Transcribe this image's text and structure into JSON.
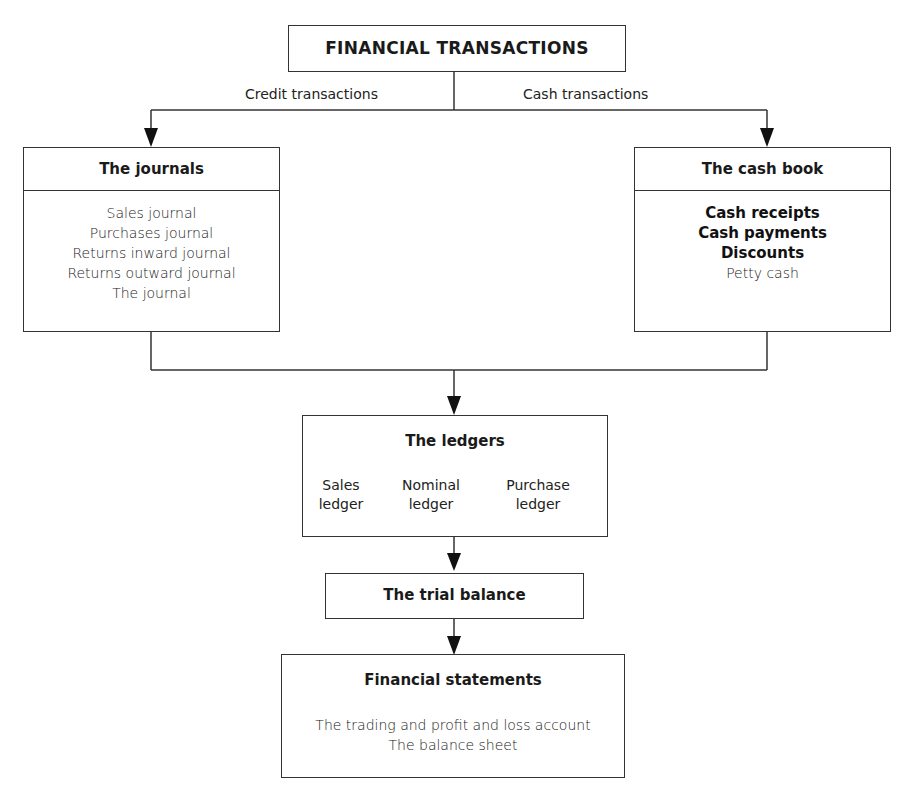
{
  "diagram": {
    "root": {
      "title": "FINANCIAL TRANSACTIONS"
    },
    "branches": {
      "credit_label": "Credit transactions",
      "cash_label": "Cash transactions"
    },
    "journals": {
      "title": "The journals",
      "items": [
        "Sales journal",
        "Purchases journal",
        "Returns inward journal",
        "Returns outward journal",
        "The journal"
      ]
    },
    "cash_book": {
      "title": "The cash book",
      "items": [
        {
          "label": "Cash receipts",
          "bold": true
        },
        {
          "label": "Cash payments",
          "bold": true
        },
        {
          "label": "Discounts",
          "bold": true
        },
        {
          "label": "Petty cash",
          "bold": false
        }
      ]
    },
    "ledgers": {
      "title": "The ledgers",
      "columns": [
        {
          "line1": "Sales",
          "line2": "ledger"
        },
        {
          "line1": "Nominal",
          "line2": "ledger"
        },
        {
          "line1": "Purchase",
          "line2": "ledger"
        }
      ]
    },
    "trial_balance": {
      "title": "The trial balance"
    },
    "financial_statements": {
      "title": "Financial statements",
      "items": [
        "The trading and profit and loss account",
        "The balance sheet"
      ]
    }
  },
  "colors": {
    "line": "#333333",
    "text": "#1a1a1a",
    "background": "#ffffff"
  }
}
